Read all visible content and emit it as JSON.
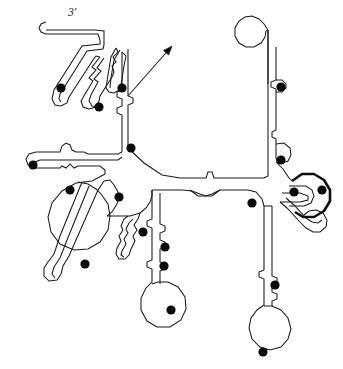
{
  "figure": {
    "kind": "rna-secondary-structure-diagram",
    "title": "",
    "background_color": "#ffffff",
    "stroke_color": "#1a1a1a",
    "dot_color": "#0a0a0a",
    "width": 343,
    "height": 369
  },
  "labels": {
    "three_prime": "3'",
    "three_prime_x": 68,
    "three_prime_y": 16
  },
  "five_prime_arrow": {
    "name": "five-prime-arrow",
    "tail_x": 128,
    "tail_y": 96,
    "tip_x": 172,
    "tip_y": 46
  },
  "modified_nucleotide_dots": [
    {
      "id": "dot-01",
      "cx": 61,
      "cy": 88,
      "r": 4.6
    },
    {
      "id": "dot-02",
      "cx": 99,
      "cy": 107,
      "r": 4.6
    },
    {
      "id": "dot-03",
      "cx": 122,
      "cy": 88,
      "r": 4.6
    },
    {
      "id": "dot-04",
      "cx": 131,
      "cy": 148,
      "r": 4.6
    },
    {
      "id": "dot-05",
      "cx": 33,
      "cy": 165,
      "r": 4.6
    },
    {
      "id": "dot-06",
      "cx": 70,
      "cy": 190,
      "r": 4.6
    },
    {
      "id": "dot-07",
      "cx": 119,
      "cy": 197,
      "r": 4.6
    },
    {
      "id": "dot-08",
      "cx": 85,
      "cy": 264,
      "r": 4.6
    },
    {
      "id": "dot-09",
      "cx": 143,
      "cy": 232,
      "r": 4.6
    },
    {
      "id": "dot-10",
      "cx": 165,
      "cy": 247,
      "r": 4.6
    },
    {
      "id": "dot-11",
      "cx": 164,
      "cy": 266,
      "r": 4.6
    },
    {
      "id": "dot-12",
      "cx": 171,
      "cy": 310,
      "r": 4.6
    },
    {
      "id": "dot-13",
      "cx": 281,
      "cy": 87,
      "r": 4.6
    },
    {
      "id": "dot-14",
      "cx": 281,
      "cy": 160,
      "r": 4.6
    },
    {
      "id": "dot-15",
      "cx": 294,
      "cy": 192,
      "r": 4.6
    },
    {
      "id": "dot-16",
      "cx": 322,
      "cy": 190,
      "r": 4.6
    },
    {
      "id": "dot-17",
      "cx": 252,
      "cy": 203,
      "r": 4.6
    },
    {
      "id": "dot-18",
      "cx": 275,
      "cy": 285,
      "r": 4.6
    },
    {
      "id": "dot-19",
      "cx": 263,
      "cy": 352,
      "r": 4.6
    }
  ],
  "strand_paths": [
    {
      "id": "path-3prime-tail",
      "name": "three-prime-tail-strand",
      "d": "M 46 22 L 41 24 L 39 28 L 41 32 L 46 34 L 98 34 L 100 40 L 100 44 L 82 46 L 54 90 L 52 99 L 55 105 L 61 106 L 67 103 L 69 97 L 93 60 L 96 56 L 100 57"
    },
    {
      "id": "path-3prime-upper",
      "name": "three-prime-upper-strand",
      "d": "M 46 30 L 95 30 L 104 31 L 104 45 L 103 49 L 87 51 L 60 94 L 59 99 L 61 102"
    },
    {
      "id": "hairpin-A-left",
      "name": "hairpin-a-left-strand",
      "d": "M 100 57 L 92 67 L 96 70 L 89 78 L 93 81 L 85 94 L 81 101 L 83 107 L 89 109 L 96 107 L 99 101 L 100 96 L 112 77 L 114 72 L 112 66 L 116 62 L 113 57 L 118 52 L 116 48"
    },
    {
      "id": "hairpin-A-right",
      "name": "hairpin-a-right-strand",
      "d": "M 104 58 L 97 68 L 101 71 L 94 79 L 98 82 L 91 95 L 89 101 L 92 106 L 98 107"
    },
    {
      "id": "hairpin-B-left",
      "name": "hairpin-b-left-strand",
      "d": "M 116 48 L 111 57 L 108 75 L 106 88 L 109 92 L 114 93 L 119 90 L 121 85 L 124 66 L 126 56 L 122 52"
    },
    {
      "id": "hairpin-B-right",
      "name": "hairpin-b-right-strand",
      "d": "M 120 50 L 114 60 L 111 78 L 110 88"
    },
    {
      "id": "stem-upper-left-outer",
      "name": "upper-left-stem-outer-strand",
      "d": "M 122 52 L 122 90 L 117 92 L 117 97 L 122 99 L 122 106 L 117 108 L 117 113 L 122 115 L 122 148"
    },
    {
      "id": "stem-upper-left-inner",
      "name": "upper-left-stem-inner-strand",
      "d": "M 128 49 L 128 96 L 133 98 L 133 103 L 128 105 L 128 148"
    },
    {
      "id": "junction-to-left-arm",
      "name": "junction-left-arm-strand",
      "d": "M 122 148 L 122 152 L 118 154 L 88 154 L 84 152 L 76 152 L 72 150 L 70 145 L 66 143 L 62 146 L 60 152 L 36 152 L 29 154 L 26 159 L 28 165 L 34 168 L 60 168 L 62 166 L 66 168 L 70 164 L 74 168 L 78 166 L 100 166 L 105 170 L 105 174"
    },
    {
      "id": "left-arm-return",
      "name": "left-arm-return-strand",
      "d": "M 122 157 L 118 160 L 40 160 L 35 162 L 34 166"
    },
    {
      "id": "big-loop",
      "name": "large-internal-loop-strand",
      "d": "M 105 174 L 92 181 L 76 183 L 62 191 L 52 203 L 48 217 L 51 232 L 60 244 L 74 250 L 88 249 L 100 242 L 108 230 L 110 216 L 108 204 L 101 194 L 96 189 L 88 184 L 78 182"
    },
    {
      "id": "diag-stem-left",
      "name": "diagonal-stem-left-strand",
      "d": "M 82 182 L 60 236 L 54 254 L 48 262 L 44 268 L 44 276 L 49 281 L 57 280 L 61 274 L 63 266 L 69 256 L 76 240 L 98 190 L 104 181 L 110 180 L 114 185"
    },
    {
      "id": "diag-stem-right",
      "name": "diagonal-stem-right-strand",
      "d": "M 89 186 L 67 240 L 60 258 L 54 267 L 52 274 L 55 278"
    },
    {
      "id": "upper-diag-to-center",
      "name": "upper-diagonal-to-center-strand",
      "d": "M 114 185 L 118 192 L 119 198 L 117 204 L 112 212 L 107 216"
    },
    {
      "id": "hairpin-C-outer",
      "name": "hairpin-c-outer-strand",
      "d": "M 128 216 L 124 219 L 121 226 L 123 230 L 119 236 L 121 241 L 117 248 L 116 254 L 119 259 L 125 259 L 129 255 L 131 249 L 135 241 L 133 236 L 137 230 L 134 225 L 138 219 L 140 213"
    },
    {
      "id": "hairpin-C-inner",
      "name": "hairpin-c-inner-strand",
      "d": "M 133 219 L 129 223 L 126 229 L 128 233 L 124 239 L 126 244 L 122 251 L 121 255 L 124 257"
    },
    {
      "id": "center-to-hairpin-c",
      "name": "center-to-hairpin-c-strand",
      "d": "M 140 213 L 146 208 L 150 202 L 152 196 L 152 190"
    },
    {
      "id": "stem-bottom-center-left",
      "name": "bottom-center-stem-left-strand",
      "d": "M 152 190 L 152 219 L 147 221 L 147 226 L 152 228 L 152 260 L 147 262 L 147 267 L 152 269 L 152 282 L 146 288 L 141 298 L 141 310 L 147 321 L 157 327 L 170 327 L 181 320 L 186 309 L 185 297 L 178 287 L 168 282 L 158 282 L 152 284"
    },
    {
      "id": "stem-bottom-center-right",
      "name": "bottom-center-stem-right-strand",
      "d": "M 160 193 L 160 224 L 165 226 L 165 231 L 160 233 L 160 240 L 165 242 L 165 247 L 160 249 L 160 262 L 165 264 L 165 269 L 160 271 L 160 284"
    },
    {
      "id": "center-junction-to-bottom",
      "name": "center-junction-to-bottom-strand",
      "d": "M 107 216 L 130 216 L 140 213"
    },
    {
      "id": "center-backbone-upper",
      "name": "center-backbone-upper-strand",
      "d": "M 128 148 L 144 163 L 162 175 L 180 178 L 206 178 L 208 172 L 212 172 L 214 178 L 264 178 L 268 176 L 268 30"
    },
    {
      "id": "center-backbone-lower",
      "name": "center-backbone-lower-strand",
      "d": "M 152 190 L 182 190 L 192 191 L 200 194 L 206 196 L 212 194 L 220 190 L 248 190 L 256 192 L 262 199 L 264 206 L 264 270"
    },
    {
      "id": "center-bulge-lower",
      "name": "center-lower-bulge-strand",
      "d": "M 190 190 L 198 196 L 212 196 L 220 190"
    },
    {
      "id": "hairpin-top-right-left",
      "name": "top-right-hairpin-left-strand",
      "d": "M 268 30 L 264 24 L 259 19 L 252 16 L 245 17 L 239 21 L 235 28 L 235 36 L 239 43 L 246 47 L 254 47 L 261 43 L 265 37 L 266 31 L 268 30"
    },
    {
      "id": "hairpin-top-right-right",
      "name": "top-right-hairpin-right-strand",
      "d": "M 276 47 L 276 80 L 271 82 L 271 87 L 276 89 L 276 130 L 272 132 L 272 137 L 276 139 L 276 158 L 278 164 L 283 169"
    },
    {
      "id": "hairpin-top-right-stem-return",
      "name": "top-right-hairpin-stem-return-strand",
      "d": "M 268 30 L 268 84"
    },
    {
      "id": "small-bulge-right-1",
      "name": "right-small-bulge-upper",
      "d": "M 276 80 L 282 80 L 286 84 L 286 88 L 282 92 L 276 92"
    },
    {
      "id": "small-bulge-right-2",
      "name": "right-small-bulge-lower",
      "d": "M 276 144 L 284 143 L 290 148 L 291 155 L 288 161 L 282 163 L 276 162"
    },
    {
      "id": "pseudoknot-arc-outer",
      "name": "pseudoknot-outer-arc",
      "d": "M 292 181 L 302 174 L 314 174 L 324 180 L 330 190 L 330 201 L 324 211 L 314 217 L 303 217 L 295 212"
    },
    {
      "id": "pseudoknot-inner-loop",
      "name": "pseudoknot-inner-loop-strand",
      "d": "M 289 186 L 306 186 L 312 190 L 314 196 L 311 203 L 304 206 L 296 206 L 289 206"
    },
    {
      "id": "pseudoknot-entry",
      "name": "pseudoknot-entry-strand",
      "d": "M 283 169 L 289 178 L 292 181"
    },
    {
      "id": "pseudoknot-exit-left",
      "name": "pseudoknot-exit-left-strand",
      "d": "M 282 193 L 292 193 L 300 193 L 308 196 L 308 200 L 300 202 L 288 202 L 280 202"
    },
    {
      "id": "lower-right-hairpin-left",
      "name": "lower-right-small-hairpin-left",
      "d": "M 280 202 L 287 208 L 300 222 L 306 228 L 313 232 L 320 232 L 326 227 L 327 220 L 323 213 L 316 210 L 309 211 L 304 215"
    },
    {
      "id": "lower-right-hairpin-right",
      "name": "lower-right-small-hairpin-right",
      "d": "M 286 198 L 294 205 L 306 218 L 312 222 L 318 223 L 322 220"
    },
    {
      "id": "bottom-right-stem-left",
      "name": "bottom-right-stem-left-strand",
      "d": "M 264 270 L 259 272 L 259 277 L 264 279 L 264 305 L 257 310 L 251 318 L 249 328 L 252 339 L 260 347 L 270 350 L 281 347 L 288 339 L 291 329 L 288 318 L 281 310 L 272 306 L 264 306"
    },
    {
      "id": "bottom-right-stem-right",
      "name": "bottom-right-stem-right-strand",
      "d": "M 272 206 L 272 276 L 277 278 L 277 283 L 272 285 L 272 292 L 277 294 L 277 299 L 272 301 L 272 306"
    },
    {
      "id": "lower-right-connector",
      "name": "lower-right-connector-strand",
      "d": "M 264 206 L 272 206"
    }
  ]
}
